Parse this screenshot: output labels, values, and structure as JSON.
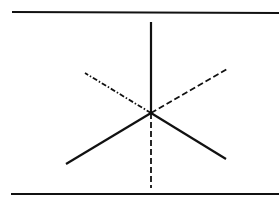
{
  "diagram": {
    "title": "",
    "stroke_color": "#111111",
    "background": "#ffffff",
    "frame": {
      "top_line": {
        "x1": 12,
        "y1": 12,
        "x2": 279,
        "y2": 13
      },
      "bottom_line": {
        "x1": 11,
        "y1": 194,
        "x2": 279,
        "y2": 194
      }
    },
    "center": {
      "x": 151,
      "y": 113
    },
    "axes": [
      {
        "name": "up-solid",
        "style": "solid",
        "x2": 151,
        "y2": 22
      },
      {
        "name": "lower-left-solid",
        "style": "solid",
        "x2": 66,
        "y2": 164
      },
      {
        "name": "lower-right-solid",
        "style": "solid",
        "x2": 226,
        "y2": 159
      },
      {
        "name": "upper-left-dashdot",
        "style": "dashdot",
        "x2": 85,
        "y2": 73
      },
      {
        "name": "upper-right-dashed",
        "style": "dashed",
        "x2": 227,
        "y2": 69
      },
      {
        "name": "down-dashed",
        "style": "dashed",
        "x2": 151,
        "y2": 188
      }
    ]
  }
}
